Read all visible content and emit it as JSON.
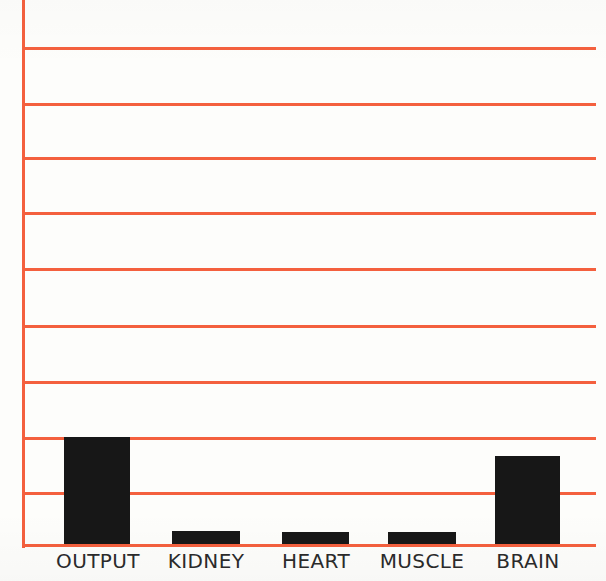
{
  "chart_data": {
    "type": "bar",
    "title": "",
    "subtitle": "",
    "xlabel": "",
    "ylabel": "",
    "categories": [
      "OUTPUT",
      "KIDNEY",
      "HEART",
      "MUSCLE",
      "BRAIN"
    ],
    "values": [
      1.95,
      0.25,
      0.22,
      0.23,
      1.62
    ],
    "ylim": [
      0,
      10
    ],
    "y_tick_values": [
      0,
      1,
      2,
      3,
      4,
      5,
      6,
      7,
      8,
      9,
      10
    ],
    "y_tick_labels": [
      "",
      "",
      "",
      "",
      "",
      "",
      "",
      "",
      "",
      "",
      ""
    ],
    "grid": true,
    "grid_axis": "y",
    "grid_count": 10,
    "legend": false,
    "legend_position": "none",
    "bar_color": "#171717",
    "grid_color": "#f4603e",
    "axis_color": "#f4603e",
    "background_color": "#fdfdfb",
    "label_color": "#2b2b2b",
    "annotations": []
  },
  "figure": {
    "name": "organ-blood-flow-bar-chart",
    "plot_left_px": 22,
    "plot_top_px": 0,
    "plot_width_px": 574,
    "plot_height_px": 547
  },
  "bars": [
    {
      "label": "OUTPUT",
      "value": 1.95,
      "left_px": 64,
      "width_px": 66,
      "top_px": 437,
      "height_px": 108
    },
    {
      "label": "KIDNEY",
      "value": 0.25,
      "left_px": 172,
      "width_px": 68,
      "top_px": 531,
      "height_px": 14
    },
    {
      "label": "HEART",
      "value": 0.22,
      "left_px": 282,
      "width_px": 67,
      "top_px": 532,
      "height_px": 13
    },
    {
      "label": "MUSCLE",
      "value": 0.23,
      "left_px": 388,
      "width_px": 68,
      "top_px": 532,
      "height_px": 13
    },
    {
      "label": "BRAIN",
      "value": 1.62,
      "left_px": 495,
      "width_px": 65,
      "top_px": 456,
      "height_px": 89
    }
  ],
  "gridlines": [
    {
      "y_px": 47
    },
    {
      "y_px": 103
    },
    {
      "y_px": 157
    },
    {
      "y_px": 212
    },
    {
      "y_px": 268
    },
    {
      "y_px": 325
    },
    {
      "y_px": 381
    },
    {
      "y_px": 437
    },
    {
      "y_px": 492
    }
  ],
  "category_labels": [
    {
      "text": "OUTPUT",
      "center_px": 98
    },
    {
      "text": "KIDNEY",
      "center_px": 206
    },
    {
      "text": "HEART",
      "center_px": 316
    },
    {
      "text": "MUSCLE",
      "center_px": 422
    },
    {
      "text": "BRAIN",
      "center_px": 528
    }
  ]
}
